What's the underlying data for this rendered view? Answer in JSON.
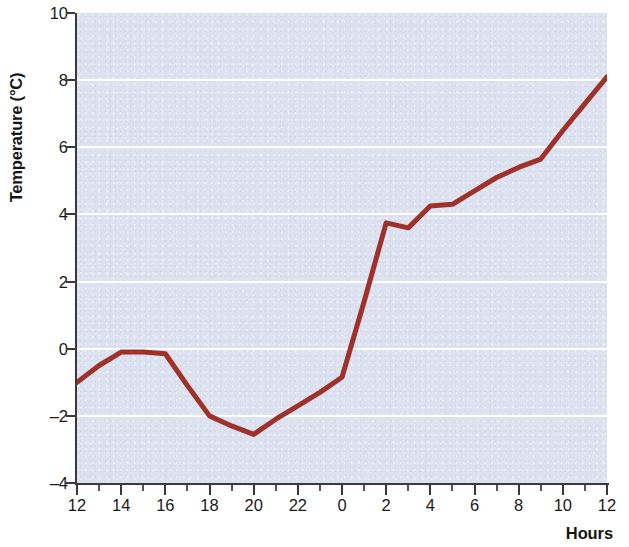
{
  "chart_data": {
    "type": "line",
    "title": "",
    "subtitle": "",
    "xlabel": "Hours",
    "ylabel": "Temperature (°C)",
    "xlim": [
      12,
      36
    ],
    "ylim": [
      -4,
      10
    ],
    "y_ticks": [
      10,
      8,
      6,
      4,
      2,
      0,
      -2,
      -4
    ],
    "y_tick_labels": [
      "10",
      "8",
      "6",
      "4",
      "2",
      "0",
      "–2",
      "–4"
    ],
    "x_ticks": [
      12,
      14,
      16,
      18,
      20,
      22,
      24,
      26,
      28,
      30,
      32,
      34,
      36
    ],
    "x_tick_labels": [
      "12",
      "14",
      "16",
      "18",
      "20",
      "22",
      "0",
      "2",
      "4",
      "6",
      "8",
      "10",
      "12"
    ],
    "x_minor_tick_step": 1,
    "grid": true,
    "grid_axis": "y",
    "grid_color": "#ffffff",
    "plot_background_color": "#dde2f0",
    "page_background_color": "#ffffff",
    "axis_color": "#3a3a3a",
    "legend": null,
    "legend_position": "none",
    "series": [
      {
        "name": "Temperature",
        "color": "#a0302a",
        "line_width": 5,
        "x": [
          12,
          13,
          14,
          15,
          16,
          17,
          18,
          19,
          20,
          21,
          22,
          23,
          24,
          25,
          26,
          27,
          28,
          29,
          30,
          31,
          32,
          33,
          34,
          35,
          36
        ],
        "values": [
          -1.0,
          -0.5,
          -0.1,
          -0.1,
          -0.15,
          -1.1,
          -2.0,
          -2.3,
          -2.55,
          -2.1,
          -1.7,
          -1.3,
          -0.85,
          1.4,
          3.75,
          3.6,
          4.25,
          4.3,
          4.7,
          5.1,
          5.4,
          5.65,
          6.5,
          7.3,
          8.1
        ]
      }
    ],
    "annotations": [
      {
        "label": "daytime maximum (afternoon plateau)",
        "x": 14,
        "y": -0.1
      },
      {
        "label": "pre-dawn minimum",
        "x": 20,
        "y": -2.55
      },
      {
        "label": "rapid post-midnight warming",
        "x": 26,
        "y": 3.75
      },
      {
        "label": "final reading",
        "x": 36,
        "y": 8.1
      }
    ]
  }
}
